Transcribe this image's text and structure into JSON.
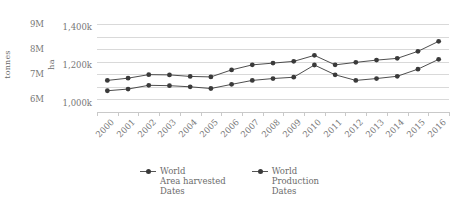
{
  "chart_data": {
    "type": "line",
    "title": "",
    "xlabel": "",
    "categories": [
      "2000",
      "2001",
      "2002",
      "2003",
      "2004",
      "2005",
      "2006",
      "2007",
      "2008",
      "2009",
      "2010",
      "2011",
      "2012",
      "2013",
      "2014",
      "2015",
      "2016"
    ],
    "grid": true,
    "legend_position": "bottom",
    "axes": {
      "left": {
        "label": "tonnes",
        "ticks": [
          "6M",
          "7M",
          "8M",
          "9M"
        ],
        "tick_values": [
          6000000,
          7000000,
          8000000,
          9000000
        ],
        "ylim": [
          5500000,
          9250000
        ]
      },
      "right_inner": {
        "label": "ha",
        "ticks": [
          "1,000k",
          "1,200k",
          "1,400k"
        ],
        "tick_values": [
          1000000,
          1200000,
          1400000
        ],
        "ylim": [
          950000,
          1450000
        ]
      }
    },
    "series": [
      {
        "name": "World\nArea harvested\nDates",
        "legend_label": "World Area harvested Dates",
        "unit": "ha",
        "color": "#3a3a3a",
        "values": [
          1063000,
          1072000,
          1092000,
          1090000,
          1084000,
          1075000,
          1097000,
          1118000,
          1128000,
          1135000,
          1200000,
          1148000,
          1118000,
          1128000,
          1140000,
          1178000,
          1230000
        ]
      },
      {
        "name": "World\nProduction\nDates",
        "legend_label": "World Production Dates",
        "unit": "tonnes",
        "color": "#3a3a3a",
        "values": [
          6760000,
          6850000,
          6990000,
          6980000,
          6920000,
          6900000,
          7180000,
          7380000,
          7450000,
          7520000,
          7760000,
          7380000,
          7480000,
          7570000,
          7640000,
          7920000,
          8320000
        ]
      }
    ],
    "legend": [
      {
        "label_line1": "World",
        "label_line2": "Area harvested",
        "label_line3": "Dates"
      },
      {
        "label_line1": "World",
        "label_line2": "Production",
        "label_line3": "Dates"
      }
    ]
  }
}
